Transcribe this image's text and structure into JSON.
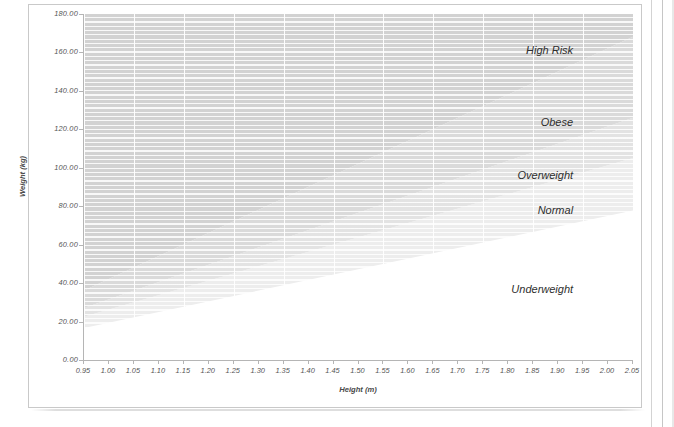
{
  "chart_data": {
    "type": "area",
    "title": "",
    "xlabel": "Height (m)",
    "ylabel": "Weight (kg)",
    "xlim": [
      0.95,
      2.05
    ],
    "ylim": [
      0.0,
      180.0
    ],
    "grid": true,
    "legend": "none",
    "x_ticks": [
      "0.95",
      "1.00",
      "1.05",
      "1.10",
      "1.15",
      "1.20",
      "1.25",
      "1.30",
      "1.35",
      "1.40",
      "1.45",
      "1.50",
      "1.55",
      "1.60",
      "1.65",
      "1.70",
      "1.75",
      "1.80",
      "1.85",
      "1.90",
      "1.95",
      "2.00",
      "2.05"
    ],
    "y_ticks": [
      "0.00",
      "20.00",
      "40.00",
      "60.00",
      "80.00",
      "100.00",
      "120.00",
      "140.00",
      "160.00",
      "180.00"
    ],
    "series": [
      {
        "name": "Underweight",
        "bmi_range": [
          0,
          18.5
        ],
        "label": "Underweight",
        "color": "#ffffff",
        "x": [
          0.95,
          2.05
        ],
        "y_upper": [
          16.69,
          77.75
        ]
      },
      {
        "name": "Normal",
        "bmi_range": [
          18.5,
          25
        ],
        "label": "Normal",
        "color": "#ededed",
        "x": [
          0.95,
          2.05
        ],
        "y_lower": [
          16.69,
          77.75
        ],
        "y_upper": [
          22.56,
          105.06
        ]
      },
      {
        "name": "Overweight",
        "bmi_range": [
          25,
          30
        ],
        "label": "Overweight",
        "color": "#e3e3e3",
        "x": [
          0.95,
          2.05
        ],
        "y_lower": [
          22.56,
          105.06
        ],
        "y_upper": [
          27.07,
          126.08
        ]
      },
      {
        "name": "Obese",
        "bmi_range": [
          30,
          40
        ],
        "label": "Obese",
        "color": "#dadada",
        "x": [
          0.95,
          2.05
        ],
        "y_lower": [
          27.07,
          126.08
        ],
        "y_upper": [
          36.1,
          168.1
        ]
      },
      {
        "name": "High Risk",
        "bmi_range": [
          40,
          999
        ],
        "label": "High Risk",
        "color": "#d2d2d2",
        "x": [
          0.95,
          2.05
        ],
        "y_lower": [
          36.1,
          168.1
        ],
        "y_upper": [
          180.0,
          180.0
        ]
      }
    ],
    "region_labels": [
      {
        "text": "High Risk",
        "x": 1.93,
        "y": 160.0
      },
      {
        "text": "Obese",
        "x": 1.93,
        "y": 123.0
      },
      {
        "text": "Overweight",
        "x": 1.93,
        "y": 95.0
      },
      {
        "text": "Normal",
        "x": 1.93,
        "y": 77.0
      },
      {
        "text": "Underweight",
        "x": 1.93,
        "y": 36.0
      }
    ]
  },
  "axes": {
    "x_title": "Height (m)",
    "y_title": "Weight (kg)"
  },
  "colors": {
    "band_high_risk": "#d2d2d2",
    "band_obese": "#dadada",
    "band_overweight": "#e3e3e3",
    "band_normal": "#ededed",
    "band_underweight": "#ffffff",
    "axis_line": "#b5b5b5",
    "tick_text": "#555555",
    "page_border": "#c9c9c9"
  }
}
